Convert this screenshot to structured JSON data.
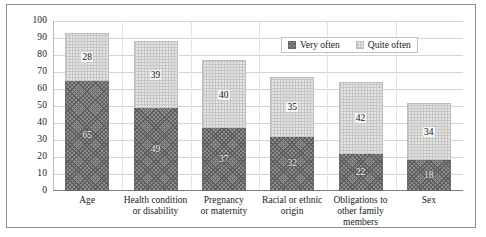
{
  "chart_data": {
    "type": "bar",
    "stacked": true,
    "title": "",
    "xlabel": "",
    "ylabel": "",
    "ylim": [
      0,
      100
    ],
    "ytick_step": 10,
    "yticks": [
      "100",
      "90",
      "80",
      "70",
      "60",
      "50",
      "40",
      "30",
      "20",
      "10",
      "0"
    ],
    "grid": true,
    "legend_position": "top-right",
    "categories": [
      "Age",
      "Health condition or disability",
      "Pregnancy or maternity",
      "Racial or ethnic origin",
      "Obligations to other family members",
      "Sex"
    ],
    "category_lines": [
      [
        "Age"
      ],
      [
        "Health condition",
        "or disability"
      ],
      [
        "Pregnancy",
        "or maternity"
      ],
      [
        "Racial or ethnic",
        "origin"
      ],
      [
        "Obligations to",
        "other family",
        "members"
      ],
      [
        "Sex"
      ]
    ],
    "series": [
      {
        "name": "Very often",
        "pattern": "dark-cross-hatch",
        "color": "#8e8e8e",
        "values": [
          65,
          49,
          37,
          32,
          22,
          18
        ]
      },
      {
        "name": "Quite often",
        "pattern": "light-dotted",
        "color": "#e4e4e4",
        "values": [
          28,
          39,
          40,
          35,
          42,
          34
        ]
      }
    ],
    "totals": [
      93,
      88,
      77,
      67,
      64,
      52
    ]
  },
  "legend": {
    "items": [
      {
        "label": "Very often"
      },
      {
        "label": "Quite often"
      }
    ]
  }
}
